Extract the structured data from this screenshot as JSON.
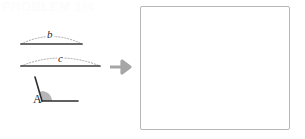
{
  "page": {
    "watermark_text": "PROBLEM 1/4",
    "background_color": "#ffffff"
  },
  "figure_panel": {
    "name": "given-constructions",
    "ink_color": "#3a3a3a",
    "arc_color": "#9a9a9a",
    "wedge_fill": "#a9a9a9",
    "elements": [
      {
        "id": "segment-b",
        "kind": "segment",
        "label": "b",
        "label_style": "italic",
        "x1": 21,
        "y1": 44,
        "x2": 82,
        "y2": 44,
        "arc_dotted": true,
        "arc_height": 12
      },
      {
        "id": "segment-c",
        "kind": "segment",
        "label": "c",
        "label_style": "italic",
        "x1": 21,
        "y1": 66,
        "x2": 100,
        "y2": 66,
        "arc_dotted": true,
        "arc_height": 13
      },
      {
        "id": "angle-a",
        "kind": "angle",
        "label": "A",
        "label_style": "roman",
        "vertex_x": 42,
        "vertex_y": 101,
        "ray1_x": 35,
        "ray1_y": 77,
        "ray2_x": 78,
        "ray2_y": 101,
        "shaded_wedge": true,
        "wedge_radius": 10
      }
    ]
  },
  "arrow": {
    "name": "implies-arrow",
    "direction": "right",
    "color": "#a6a6a6"
  },
  "answer_box": {
    "name": "answer-canvas",
    "content": "",
    "border_color": "#b6b6b6",
    "fill_color": "#ffffff",
    "x": 140,
    "y": 6,
    "width": 150,
    "height": 124
  }
}
